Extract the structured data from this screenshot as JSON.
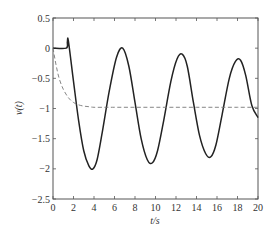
{
  "chart_data": {
    "type": "line",
    "title": "",
    "xlabel": "t/s",
    "ylabel": "v(t)",
    "xlim": [
      0,
      20
    ],
    "ylim": [
      -2.5,
      0.5
    ],
    "xticks": [
      0,
      2,
      4,
      6,
      8,
      10,
      12,
      14,
      16,
      18,
      20
    ],
    "xtick_labels": [
      "0",
      "2",
      "4",
      "6",
      "8",
      "10",
      "12",
      "14",
      "16",
      "18",
      "20"
    ],
    "yticks": [
      0.5,
      0,
      -0.5,
      -1,
      -1.5,
      -2,
      -2.5
    ],
    "ytick_labels": [
      "0.5",
      "0",
      "−0.5",
      "−1",
      "−1.5",
      "−2",
      "−2.5"
    ],
    "grid": false,
    "legend": null,
    "series": [
      {
        "name": "solid",
        "style": "solid",
        "color": "#222222",
        "x": [
          0,
          1.3,
          1.4,
          1.5,
          2.0,
          2.5,
          3.0,
          3.5,
          3.9,
          4.3,
          4.8,
          5.5,
          6.2,
          6.8,
          7.4,
          8.0,
          8.6,
          9.2,
          9.7,
          10.2,
          10.8,
          11.5,
          12.1,
          12.6,
          13.1,
          13.7,
          14.3,
          14.9,
          15.4,
          15.9,
          16.5,
          17.2,
          17.8,
          18.3,
          18.8,
          19.4,
          20.0
        ],
        "values": [
          0,
          0,
          0.1,
          0.12,
          -0.55,
          -1.2,
          -1.7,
          -1.95,
          -2.0,
          -1.85,
          -1.4,
          -0.7,
          -0.15,
          0.0,
          -0.3,
          -0.9,
          -1.5,
          -1.85,
          -1.9,
          -1.7,
          -1.2,
          -0.55,
          -0.18,
          -0.1,
          -0.3,
          -0.9,
          -1.45,
          -1.75,
          -1.8,
          -1.6,
          -1.1,
          -0.5,
          -0.22,
          -0.2,
          -0.45,
          -0.95,
          -1.15
        ]
      },
      {
        "name": "dashed",
        "style": "dashed",
        "color": "#777777",
        "x": [
          0,
          0.3,
          0.6,
          1.0,
          1.5,
          2.0,
          2.5,
          3.0,
          3.5,
          4.0,
          5.0,
          6.0,
          8.0,
          10.0,
          12.0,
          14.0,
          16.0,
          18.0,
          20.0
        ],
        "values": [
          0,
          -0.28,
          -0.5,
          -0.68,
          -0.82,
          -0.9,
          -0.94,
          -0.96,
          -0.97,
          -0.98,
          -0.98,
          -0.98,
          -0.98,
          -0.98,
          -0.98,
          -0.98,
          -0.98,
          -0.98,
          -0.98
        ]
      }
    ]
  }
}
